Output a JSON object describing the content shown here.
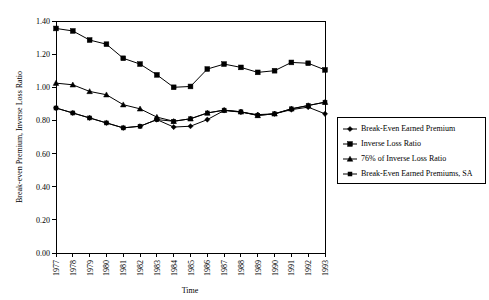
{
  "chart_data": {
    "type": "line",
    "title": "",
    "xlabel": "Time",
    "ylabel": "Break-even Premium, Inverse Loss Ratio",
    "x": [
      1977,
      1978,
      1979,
      1980,
      1981,
      1982,
      1983,
      1984,
      1985,
      1986,
      1987,
      1988,
      1989,
      1990,
      1991,
      1992,
      1993
    ],
    "categories": [
      "1977",
      "1978",
      "1979",
      "1980",
      "1981",
      "1982",
      "1983",
      "1984",
      "1985",
      "1986",
      "1987",
      "1988",
      "1989",
      "1990",
      "1991",
      "1992",
      "1993"
    ],
    "xlim": [
      1977,
      1993
    ],
    "ylim": [
      0.0,
      1.4
    ],
    "yticks": [
      "0.00",
      "0.20",
      "0.40",
      "0.60",
      "0.80",
      "1.00",
      "1.20",
      "1.40"
    ],
    "ytick_values": [
      0.0,
      0.2,
      0.4,
      0.6,
      0.8,
      1.0,
      1.2,
      1.4
    ],
    "grid": false,
    "legend_position": "right",
    "series": [
      {
        "name": "Break-Even Earned Premium",
        "marker": "diamond",
        "values": [
          0.875,
          0.845,
          0.815,
          0.785,
          0.755,
          0.765,
          0.805,
          0.76,
          0.765,
          0.805,
          0.86,
          0.85,
          0.835,
          0.84,
          0.865,
          0.88,
          0.84
        ]
      },
      {
        "name": "Inverse Loss Ratio",
        "marker": "square",
        "values": [
          1.355,
          1.34,
          1.285,
          1.26,
          1.175,
          1.14,
          1.075,
          1.0,
          1.005,
          1.11,
          1.14,
          1.12,
          1.09,
          1.1,
          1.15,
          1.145,
          1.105
        ]
      },
      {
        "name": "76% of Inverse Loss Ratio",
        "marker": "triangle",
        "values": [
          1.025,
          1.015,
          0.975,
          0.955,
          0.895,
          0.87,
          0.82,
          0.795,
          0.81,
          0.845,
          0.862,
          0.852,
          0.83,
          0.84,
          0.87,
          0.89,
          0.91
        ]
      },
      {
        "name": "Break-Even Earned Premiums, SA",
        "marker": "square-small",
        "values": [
          0.875,
          0.845,
          0.815,
          0.785,
          0.755,
          0.765,
          0.805,
          0.795,
          0.81,
          0.845,
          0.862,
          0.852,
          0.83,
          0.84,
          0.87,
          0.89,
          0.91
        ]
      }
    ]
  },
  "legend": {
    "entries": [
      {
        "label": "Break-Even Earned Premium"
      },
      {
        "label": "Inverse Loss Ratio"
      },
      {
        "label": "76% of Inverse Loss Ratio"
      },
      {
        "label": "Break-Even Earned Premiums, SA"
      }
    ]
  },
  "axes": {
    "x_title": "Time",
    "y_title": "Break-even Premium, Inverse Loss Ratio"
  }
}
